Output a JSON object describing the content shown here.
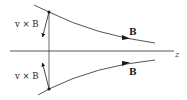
{
  "diagram": {
    "type": "magnetic-field-lines-converging",
    "axis": {
      "label": "z"
    },
    "field_lines": [
      {
        "id": "top",
        "label": "B",
        "direction": "right"
      },
      {
        "id": "bottom",
        "label": "B",
        "direction": "right"
      }
    ],
    "force_vectors": [
      {
        "id": "top",
        "label": "v × B",
        "direction": "toward-axis"
      },
      {
        "id": "bottom",
        "label": "v × B",
        "direction": "toward-axis"
      }
    ],
    "colors": {
      "stroke": "#2a2a2a",
      "text": "#1a1a1a",
      "background": "#ffffff"
    }
  }
}
